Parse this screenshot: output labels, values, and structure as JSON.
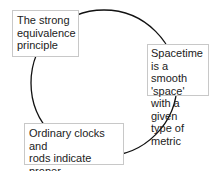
{
  "diagram": {
    "type": "cycle",
    "line_color": "#111111",
    "box_border_color": "#c8c8c8",
    "nodes": [
      {
        "id": "n1",
        "label": "The strong\nequivalence\nprinciple"
      },
      {
        "id": "n2",
        "label": "Spacetime is a\nsmooth 'space'\nwith a given\ntype of metric"
      },
      {
        "id": "n3",
        "label": "Ordinary clocks and\nrods indicate proper\ntime and distance"
      }
    ]
  }
}
